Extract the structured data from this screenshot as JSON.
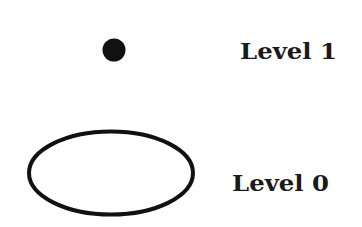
{
  "diagram": {
    "levels": [
      {
        "id": "level-1",
        "label": "Level 1",
        "shape": "filled-dot"
      },
      {
        "id": "level-0",
        "label": "Level 0",
        "shape": "outlined-ellipse"
      }
    ]
  },
  "colors": {
    "ink": "#111111",
    "background": "#ffffff"
  }
}
